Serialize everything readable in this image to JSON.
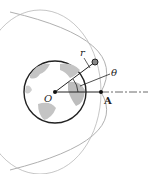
{
  "diagram": {
    "labels": {
      "origin": "O",
      "radius": "r",
      "angle": "θ",
      "point": "A"
    },
    "colors": {
      "orbit": "#b0b0b0",
      "land": "#bdbdbd",
      "ocean": "#ffffff",
      "line": "#222222"
    }
  }
}
